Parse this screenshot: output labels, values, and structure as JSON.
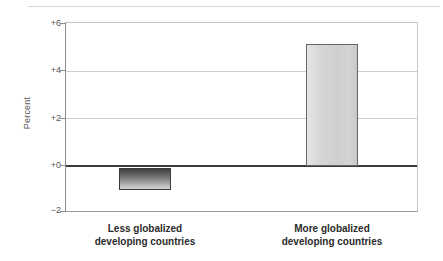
{
  "chart_data": {
    "type": "bar",
    "title": "",
    "subtitle": "",
    "xlabel": "",
    "ylabel": "Percent",
    "ylim": [
      -2,
      6
    ],
    "yticks": [
      6,
      4,
      2,
      0,
      -2
    ],
    "ytick_labels": [
      "+6",
      "+4",
      "+2",
      "+0",
      "−2"
    ],
    "grid": true,
    "legend": false,
    "zero_line": true,
    "categories": [
      "Less globalized developing countries",
      "More globalized developing countries"
    ],
    "category_lines": [
      [
        "Less globalized",
        "developing countries"
      ],
      [
        "More globalized",
        "developing countries"
      ]
    ],
    "values": [
      -1.05,
      5.1
    ],
    "colors": {
      "negative_bar_top": "#3f3f3f",
      "negative_bar_bottom": "#cfcfcf",
      "positive_bar": "#d6d6d6",
      "bar_outline": "#3c3c3c",
      "gridline": "#cfcfcf",
      "zero_line": "#3a3a3a",
      "axis": "#8c8c8c",
      "tick_text": "#555555",
      "label_text": "#2b2b2b",
      "background": "#ffffff"
    }
  },
  "axes": {
    "y_title": "Percent",
    "ticks": [
      {
        "label": "+6"
      },
      {
        "label": "+4"
      },
      {
        "label": "+2"
      },
      {
        "label": "+0"
      },
      {
        "label": "−2"
      }
    ]
  },
  "bars": [
    {
      "name": "less-globalized",
      "line1": "Less globalized",
      "line2": "developing countries",
      "value": "-1.05"
    },
    {
      "name": "more-globalized",
      "line1": "More globalized",
      "line2": "developing countries",
      "value": "5.1"
    }
  ]
}
